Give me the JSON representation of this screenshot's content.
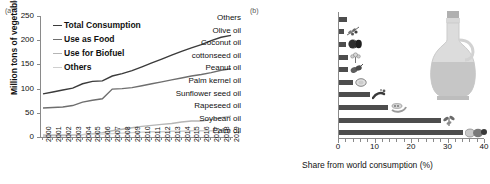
{
  "figure": {
    "panel_a_label": "(a)",
    "panel_b_label": "(b)"
  },
  "chart_data": [
    {
      "type": "line",
      "panel": "(a)",
      "title": "",
      "xlabel": "",
      "ylabel": "Million tons of vegetable oil",
      "ylim": [
        0,
        250
      ],
      "yticks": [
        0,
        50,
        100,
        150,
        200,
        250
      ],
      "grid": false,
      "legend_position": "top-left",
      "x": [
        2000,
        2001,
        2002,
        2003,
        2004,
        2005,
        2006,
        2007,
        2008,
        2009,
        2010,
        2011,
        2012,
        2013,
        2014,
        2015,
        2016,
        2017,
        2018,
        2019
      ],
      "categories": [
        "2000",
        "2001",
        "2002",
        "2003",
        "2004",
        "2005",
        "2006",
        "2007",
        "2008",
        "2009",
        "2010",
        "2011",
        "2012",
        "2013",
        "2014",
        "2015",
        "2016",
        "2017",
        "2018",
        "2019"
      ],
      "series": [
        {
          "name": "Total Consumption",
          "color": "#3b3b3b",
          "values": [
            89,
            93,
            97,
            101,
            110,
            115,
            116,
            126,
            131,
            137,
            145,
            153,
            161,
            169,
            177,
            184,
            191,
            199,
            206,
            210
          ]
        },
        {
          "name": "Use as Food",
          "color": "#6e6e6e",
          "values": [
            60,
            61,
            62,
            65,
            72,
            76,
            79,
            99,
            100,
            102,
            106,
            110,
            114,
            118,
            122,
            126,
            129,
            133,
            138,
            141
          ]
        },
        {
          "name": "Use for Biofuel",
          "color": "#b5b5b5",
          "values": [
            2,
            3,
            3,
            4,
            5,
            7,
            9,
            13,
            16,
            19,
            22,
            24,
            26,
            28,
            31,
            33,
            33,
            36,
            40,
            43
          ]
        },
        {
          "name": "Others",
          "color": "#cfcfcf",
          "values": [
            5,
            5,
            5,
            5,
            5,
            6,
            6,
            7,
            8,
            9,
            10,
            11,
            11,
            12,
            12,
            13,
            13,
            13,
            14,
            14
          ]
        }
      ]
    },
    {
      "type": "bar",
      "panel": "(b)",
      "orientation": "horizontal",
      "title": "",
      "xlabel": "Share from world consumption (%)",
      "ylabel": "",
      "xlim": [
        0,
        40
      ],
      "xticks": [
        0,
        10,
        20,
        30,
        40
      ],
      "grid": false,
      "bar_color": "#4d4d4d",
      "categories": [
        "Palm oil",
        "Soybean oil",
        "Rapeseed oil",
        "Sunflower seed oil",
        "Palm kernel oil",
        "Peanut oil",
        "cottonseed oil",
        "Coconut oil",
        "Olive oil",
        "Others"
      ],
      "values": [
        34.0,
        28.0,
        13.5,
        8.5,
        3.7,
        2.6,
        2.5,
        1.8,
        1.5,
        2.2
      ],
      "icons": [
        {
          "category": "Palm oil",
          "icon": "palm-fruit-icon"
        },
        {
          "category": "Soybean oil",
          "icon": "soybean-plant-icon"
        },
        {
          "category": "Rapeseed oil",
          "icon": "rapeseed-pod-icon"
        },
        {
          "category": "Sunflower seed oil",
          "icon": "sunflower-seed-icon"
        },
        {
          "category": "Palm kernel oil",
          "icon": "palm-kernel-icon"
        },
        {
          "category": "Peanut oil",
          "icon": "peanut-icon"
        },
        {
          "category": "cottonseed oil",
          "icon": "cotton-boll-icon"
        },
        {
          "category": "Coconut oil",
          "icon": "coconut-icon"
        },
        {
          "category": "Olive oil",
          "icon": "olive-branch-icon"
        },
        {
          "category": "Others",
          "icon": "none"
        }
      ],
      "decoration": "oil-bottle-icon"
    }
  ]
}
